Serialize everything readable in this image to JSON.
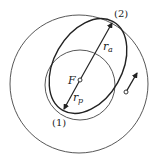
{
  "diagram": {
    "labels": {
      "apoapsis": "(2)",
      "periapsis": "(1)",
      "focus": "F",
      "r_apo": "r",
      "r_apo_sub": "a",
      "r_peri": "r",
      "r_peri_sub": "p"
    },
    "colors": {
      "stroke": "#222222",
      "background": "#ffffff"
    },
    "elements": {
      "outer_circle": {
        "cx": 79,
        "cy": 84,
        "r": 69
      },
      "inner_circle": {
        "cx": 80,
        "cy": 85,
        "r": 35
      },
      "transfer_ellipse": {
        "cx": 88,
        "cy": 66,
        "rx": 51,
        "ry": 34,
        "rotation_deg": -60.4
      },
      "focus": {
        "x": 80,
        "y": 80
      },
      "satellite": {
        "x": 126,
        "y": 92
      }
    }
  }
}
